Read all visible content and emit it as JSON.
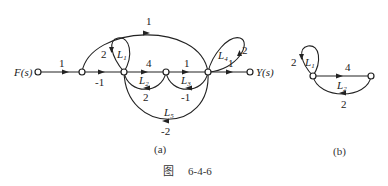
{
  "figure": {
    "caption_prefix": "图",
    "caption_number": "6-4-6",
    "subfig_a_label": "(a)",
    "subfig_b_label": "(b)"
  },
  "graph_a": {
    "input_label": "F(s)",
    "output_label": "Y(s)",
    "branches": {
      "f_to_n1": "1",
      "n1_to_n2": "-1",
      "top_feedforward": "1",
      "n2_self_loop": "2",
      "n2_to_n3": "4",
      "n3_to_n4": "1",
      "n4_to_y": "1",
      "n4_self_loop": "2",
      "n3_to_n2_back": "2",
      "n4_to_n3_back": "-1",
      "n4_to_n2_back": "-2"
    },
    "loops": {
      "L1": "L",
      "L1_sub": "1",
      "L2": "L",
      "L2_sub": "2",
      "L3": "L",
      "L3_sub": "3",
      "L4": "L",
      "L4_sub": "4",
      "L5": "L",
      "L5_sub": "5"
    }
  },
  "graph_b": {
    "self_loop_gain": "2",
    "forward_gain": "4",
    "back_gain": "2",
    "L1": "L",
    "L1_sub": "1",
    "L2": "L",
    "L2_sub": "2"
  }
}
